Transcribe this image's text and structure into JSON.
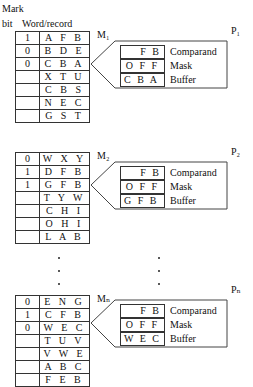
{
  "header": {
    "mark_label": "Mark",
    "bit_label": "bit",
    "word_label": "Word/record"
  },
  "modules": [
    {
      "memory_label": "M₁",
      "processor_label": "P₁",
      "rows": [
        {
          "mark": "1",
          "word": "A F B"
        },
        {
          "mark": "0",
          "word": "B D E"
        },
        {
          "mark": "0",
          "word": "C B A"
        },
        {
          "mark": "",
          "word": "X T U"
        },
        {
          "mark": "",
          "word": "C B S"
        },
        {
          "mark": "",
          "word": "N E C"
        },
        {
          "mark": "",
          "word": "G S T"
        }
      ],
      "registers": {
        "comparand": {
          "value": "F B",
          "label": "Comparand"
        },
        "mask": {
          "value": "O F F",
          "label": "Mask"
        },
        "buffer": {
          "value": "C B A",
          "label": "Buffer"
        }
      }
    },
    {
      "memory_label": "M₂",
      "processor_label": "P₂",
      "rows": [
        {
          "mark": "0",
          "word": "W X Y"
        },
        {
          "mark": "1",
          "word": "D F B"
        },
        {
          "mark": "1",
          "word": "G F B"
        },
        {
          "mark": "",
          "word": "T Y W"
        },
        {
          "mark": "",
          "word": "C H I"
        },
        {
          "mark": "",
          "word": "O H I"
        },
        {
          "mark": "",
          "word": "L A B"
        }
      ],
      "registers": {
        "comparand": {
          "value": "F B",
          "label": "Comparand"
        },
        "mask": {
          "value": "O F F",
          "label": "Mask"
        },
        "buffer": {
          "value": "G F B",
          "label": "Buffer"
        }
      }
    },
    {
      "memory_label": "Mₙ",
      "processor_label": "Pₙ",
      "rows": [
        {
          "mark": "0",
          "word": "E N G"
        },
        {
          "mark": "1",
          "word": "C F B"
        },
        {
          "mark": "0",
          "word": "W E C"
        },
        {
          "mark": "",
          "word": "T U V"
        },
        {
          "mark": "",
          "word": "V W E"
        },
        {
          "mark": "",
          "word": "A B C"
        },
        {
          "mark": "",
          "word": "F E B"
        }
      ],
      "registers": {
        "comparand": {
          "value": "F B",
          "label": "Comparand"
        },
        "mask": {
          "value": "O F F",
          "label": "Mask"
        },
        "buffer": {
          "value": "W E C",
          "label": "Buffer"
        }
      }
    }
  ]
}
